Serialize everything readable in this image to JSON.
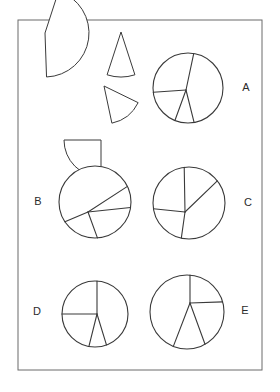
{
  "page": {
    "width": 280,
    "height": 392,
    "background_color": "#ffffff",
    "frame": {
      "x": 18,
      "y": 20,
      "width": 244,
      "height": 350,
      "stroke_color": "#6b6b6b"
    },
    "line_color": "#3a3a3a",
    "label_color": "#2b2b2b"
  },
  "loose_pieces": {
    "description": "Four detached circular sectors arranged at the upper-left of the frame",
    "count": 4,
    "items": [
      {
        "name": "large-sector-piece",
        "shape": "circular sector",
        "approx_angle_degrees": 160,
        "radius": 44,
        "pivot_x": 45,
        "pivot_y": 33,
        "start_angle": -88,
        "end_angle": 72,
        "rotation": 0
      },
      {
        "name": "narrow-wedge-piece",
        "shape": "circular sector",
        "approx_angle_degrees": 36,
        "radius": 45,
        "pivot_x": 121,
        "pivot_y": 32,
        "start_angle": -108,
        "end_angle": -72,
        "rotation": 0
      },
      {
        "name": "medium-wedge-piece",
        "shape": "circular sector",
        "approx_angle_degrees": 52,
        "radius": 38,
        "pivot_x": 104,
        "pivot_y": 86,
        "start_angle": -78,
        "end_angle": -26,
        "rotation": 0
      },
      {
        "name": "quarter-circle-piece",
        "shape": "circular sector",
        "approx_angle_degrees": 90,
        "radius": 37,
        "pivot_x": 101,
        "pivot_y": 140,
        "start_angle": 180,
        "end_angle": 270,
        "rotation": 0
      }
    ]
  },
  "circles": [
    {
      "label": "A",
      "name": "circle-a",
      "cx": 188,
      "cy": 88,
      "r": 35,
      "vertex_x": 186,
      "vertex_y": 90,
      "cut_angles": [
        78,
        184,
        250,
        284
      ],
      "sector_count": 4,
      "label_x": 246,
      "label_y": 88
    },
    {
      "label": "B",
      "name": "circle-b",
      "cx": 95,
      "cy": 202,
      "r": 36,
      "vertex_x": 88,
      "vertex_y": 212,
      "cut_angles": [
        33,
        6,
        203,
        290
      ],
      "sector_count": 4,
      "label_x": 38,
      "label_y": 202
    },
    {
      "label": "C",
      "name": "circle-c",
      "cx": 189,
      "cy": 203,
      "r": 36,
      "vertex_x": 185,
      "vertex_y": 212,
      "cut_angles": [
        91,
        44,
        174,
        262
      ],
      "sector_count": 4,
      "label_x": 248,
      "label_y": 203
    },
    {
      "label": "D",
      "name": "circle-d",
      "cx": 95,
      "cy": 314,
      "r": 33,
      "vertex_x": 97,
      "vertex_y": 314,
      "cut_angles": [
        90,
        180,
        256,
        287
      ],
      "sector_count": 4,
      "label_x": 37,
      "label_y": 312
    },
    {
      "label": "E",
      "name": "circle-e",
      "cx": 187,
      "cy": 312,
      "r": 37,
      "vertex_x": 190,
      "vertex_y": 303,
      "cut_angles": [
        90,
        2,
        249,
        290
      ],
      "sector_count": 4,
      "label_x": 245,
      "label_y": 311
    }
  ]
}
